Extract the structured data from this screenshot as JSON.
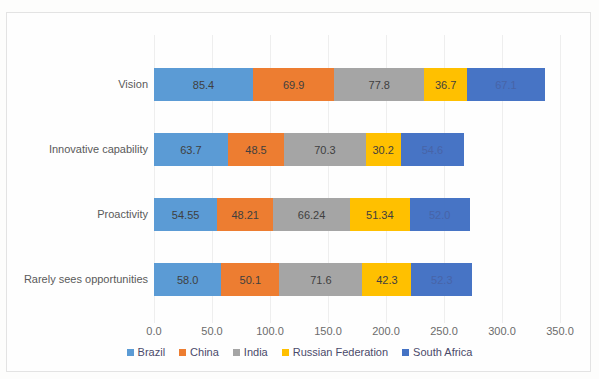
{
  "chart_data": {
    "type": "bar",
    "orientation": "horizontal",
    "stacked": true,
    "title": "",
    "xlabel": "",
    "ylabel": "",
    "xlim": [
      0,
      350
    ],
    "xticks": [
      "0.0",
      "50.0",
      "100.0",
      "150.0",
      "200.0",
      "250.0",
      "300.0",
      "350.0"
    ],
    "xtick_values": [
      0,
      50,
      100,
      150,
      200,
      250,
      300,
      350
    ],
    "grid": true,
    "legend_position": "bottom",
    "categories": [
      "Vision",
      "Innovative capability",
      "Proactivity",
      "Rarely sees opportunities"
    ],
    "series": [
      {
        "name": "Brazil",
        "color": "#5B9BD5",
        "values": [
          85.4,
          63.7,
          54.55,
          58.0
        ],
        "labels": [
          "85.4",
          "63.7",
          "54.55",
          "58.0"
        ]
      },
      {
        "name": "China",
        "color": "#ED7D31",
        "values": [
          69.9,
          48.5,
          48.21,
          50.1
        ],
        "labels": [
          "69.9",
          "48.5",
          "48.21",
          "50.1"
        ]
      },
      {
        "name": "India",
        "color": "#A5A5A5",
        "values": [
          77.8,
          70.3,
          66.24,
          71.6
        ],
        "labels": [
          "77.8",
          "70.3",
          "66.24",
          "71.6"
        ]
      },
      {
        "name": "Russian Federation",
        "color": "#FFC000",
        "values": [
          36.7,
          30.2,
          51.34,
          42.3
        ],
        "labels": [
          "36.7",
          "30.2",
          "51.34",
          "42.3"
        ]
      },
      {
        "name": "South Africa",
        "color": "#4472C4",
        "values": [
          67.1,
          54.6,
          52.0,
          52.3
        ],
        "labels": [
          "67.1",
          "54.6",
          "52.0",
          "52.3"
        ]
      }
    ]
  }
}
